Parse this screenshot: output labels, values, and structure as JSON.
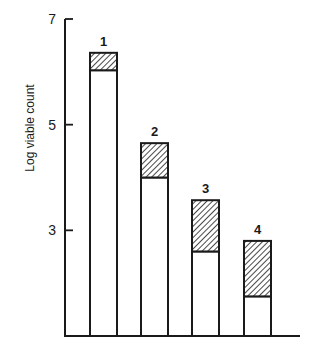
{
  "chart_data": {
    "type": "bar",
    "stacked": true,
    "title": "",
    "xlabel": "",
    "ylabel": "Log viable count",
    "ylim": [
      1,
      7
    ],
    "yticks": [
      7,
      5,
      3
    ],
    "ytick_labels": [
      "7",
      "5",
      "3"
    ],
    "grid": false,
    "legend": null,
    "categories": [
      "1",
      "2",
      "3",
      "4"
    ],
    "series": [
      {
        "name": "lower (open) segment",
        "fill": "white",
        "values": [
          6.03,
          4.0,
          2.6,
          1.75
        ]
      },
      {
        "name": "upper (hatched) segment",
        "fill": "hatched",
        "values": [
          0.33,
          0.65,
          0.97,
          1.05
        ]
      }
    ],
    "bar_totals": [
      6.36,
      4.65,
      3.57,
      2.8
    ]
  },
  "colors": {
    "ink": "#1a1a1a",
    "background": "#ffffff"
  }
}
